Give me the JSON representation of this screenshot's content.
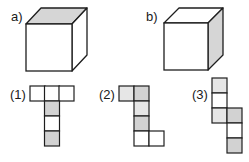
{
  "cubes": [
    {
      "label": "a)",
      "shaded_face": "top",
      "label_x": 11,
      "label_y": 21,
      "front": [
        26,
        24,
        46,
        47
      ],
      "offset": [
        15,
        -16
      ]
    },
    {
      "label": "b)",
      "shaded_face": "right",
      "label_x": 146,
      "label_y": 21,
      "front": [
        164,
        23,
        44,
        47
      ],
      "offset": [
        15,
        -15
      ]
    }
  ],
  "nets": [
    {
      "label": "(1)",
      "label_x": 10,
      "label_y": 99,
      "cells": [
        {
          "x": 30,
          "y": 86,
          "fill": "white"
        },
        {
          "x": 44.5,
          "y": 86,
          "fill": "white"
        },
        {
          "x": 59,
          "y": 86,
          "fill": "white"
        },
        {
          "x": 44.5,
          "y": 101,
          "fill": "gray"
        },
        {
          "x": 44.5,
          "y": 116,
          "fill": "white"
        },
        {
          "x": 44.5,
          "y": 131,
          "fill": "gray"
        }
      ]
    },
    {
      "label": "(2)",
      "label_x": 99,
      "label_y": 99,
      "cells": [
        {
          "x": 119,
          "y": 86,
          "fill": "light"
        },
        {
          "x": 134,
          "y": 86,
          "fill": "gray"
        },
        {
          "x": 134,
          "y": 101,
          "fill": "light"
        },
        {
          "x": 134,
          "y": 116,
          "fill": "gray"
        },
        {
          "x": 134,
          "y": 131,
          "fill": "white"
        },
        {
          "x": 149,
          "y": 131,
          "fill": "white"
        }
      ]
    },
    {
      "label": "(3)",
      "label_x": 192,
      "label_y": 99,
      "cells": [
        {
          "x": 212,
          "y": 78,
          "fill": "light"
        },
        {
          "x": 212,
          "y": 93,
          "fill": "white"
        },
        {
          "x": 212,
          "y": 108,
          "fill": "light"
        },
        {
          "x": 227,
          "y": 108,
          "fill": "gray"
        },
        {
          "x": 227,
          "y": 123,
          "fill": "white"
        },
        {
          "x": 227,
          "y": 138,
          "fill": "gray"
        }
      ]
    }
  ],
  "cell_size": 15,
  "colors": {
    "white": "#ffffff",
    "light": "#e6e6e6",
    "gray": "#d2d2d2",
    "stroke": "#1e1e1e",
    "cube_shade": "#d6d6d6"
  }
}
